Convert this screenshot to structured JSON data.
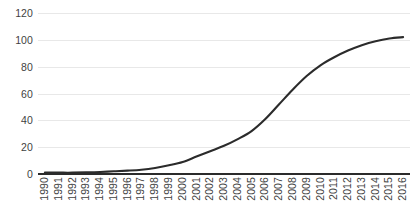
{
  "chart_data": {
    "type": "line",
    "title": "",
    "subtitle": "",
    "xlabel": "",
    "ylabel": "",
    "xlim": [
      "1990",
      "2016"
    ],
    "ylim": [
      0,
      120
    ],
    "yticks": [
      0,
      20,
      40,
      60,
      80,
      100,
      120
    ],
    "grid": "horizontal-only",
    "legend": "none",
    "line_color": "#2b2b2b",
    "gridline_color": "#e8e8e8",
    "axis_color": "#2b2b2b",
    "tick_label_color": "#3f3f3f",
    "background": "#ffffff",
    "categories": [
      "1990",
      "1991",
      "1992",
      "1993",
      "1994",
      "1995",
      "1996",
      "1997",
      "1998",
      "1999",
      "2000",
      "2001",
      "2002",
      "2003",
      "2004",
      "2005",
      "2006",
      "2007",
      "2008",
      "2009",
      "2010",
      "2011",
      "2012",
      "2013",
      "2014",
      "2015",
      "2016"
    ],
    "values": [
      1,
      1,
      1,
      1.2,
      1.5,
      2,
      2.5,
      3.2,
      4.5,
      6.5,
      9,
      13,
      17,
      21,
      26,
      32,
      41,
      52,
      63,
      73,
      81,
      87,
      92,
      96,
      99,
      101,
      102
    ],
    "series": [
      {
        "name": "",
        "values": [
          1,
          1,
          1,
          1.2,
          1.5,
          2,
          2.5,
          3.2,
          4.5,
          6.5,
          9,
          13,
          17,
          21,
          26,
          32,
          41,
          52,
          63,
          73,
          81,
          87,
          92,
          96,
          99,
          101,
          102
        ]
      }
    ],
    "annotations": []
  }
}
